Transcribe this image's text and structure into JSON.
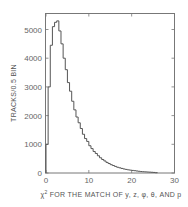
{
  "chart_data": {
    "type": "bar",
    "style": "step-histogram",
    "title": "",
    "xlabel": "χ² FOR THE MATCH OF y, z, φ, θ, AND p",
    "xlabel_parts": {
      "chi": "χ",
      "sup": "2",
      "rest": " FOR THE MATCH OF y, z, φ, θ, AND p"
    },
    "ylabel": "TRACKS/0.5 BIN",
    "xlim": [
      0,
      30
    ],
    "ylim": [
      0,
      5500
    ],
    "bin_width": 0.5,
    "grid": false,
    "legend": null,
    "xticks": [
      0,
      10,
      20,
      30
    ],
    "xtick_labels": [
      "0",
      "10",
      "20",
      "30"
    ],
    "yticks": [
      0,
      1000,
      2000,
      3000,
      4000,
      5000
    ],
    "ytick_labels": [
      "0",
      "1000",
      "2000",
      "3000",
      "4000",
      "5000"
    ],
    "bin_edges_start": [
      0,
      0.5,
      1,
      1.5,
      2,
      2.5,
      3,
      3.5,
      4,
      4.5,
      5,
      5.5,
      6,
      6.5,
      7,
      7.5,
      8,
      8.5,
      9,
      9.5,
      10,
      10.5,
      11,
      11.5,
      12,
      12.5,
      13,
      13.5,
      14,
      14.5,
      15,
      15.5,
      16,
      16.5,
      17,
      17.5,
      18,
      18.5,
      19,
      19.5,
      20,
      20.5,
      21,
      21.5,
      22,
      22.5,
      23,
      23.5,
      24,
      24.5,
      25,
      25.5
    ],
    "values": [
      1000,
      3000,
      4450,
      5100,
      5250,
      5300,
      4950,
      4500,
      4000,
      3600,
      3150,
      2850,
      2500,
      2200,
      1950,
      1750,
      1550,
      1350,
      1200,
      1100,
      950,
      850,
      750,
      680,
      600,
      530,
      470,
      420,
      370,
      330,
      290,
      260,
      230,
      200,
      180,
      160,
      140,
      125,
      110,
      100,
      90,
      80,
      70,
      60,
      50,
      45,
      40,
      35,
      30,
      25,
      20,
      10
    ]
  }
}
